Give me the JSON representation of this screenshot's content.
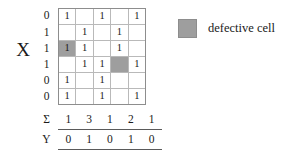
{
  "figure": {
    "axis_label_x": "X",
    "row_labels": [
      "0",
      "1",
      "1",
      "1",
      "0",
      "0"
    ],
    "grid": {
      "rows": 6,
      "cols": 5,
      "cells": [
        [
          "1",
          "",
          "1",
          "",
          "1"
        ],
        [
          "",
          "1",
          "",
          "1",
          ""
        ],
        [
          "1",
          "1",
          "",
          "1",
          ""
        ],
        [
          "",
          "1",
          "1",
          "",
          "1"
        ],
        [
          "1",
          "",
          "1",
          "",
          ""
        ],
        [
          "1",
          "",
          "1",
          "",
          "1"
        ]
      ],
      "defective": [
        [
          2,
          0
        ],
        [
          3,
          3
        ]
      ]
    },
    "summary": {
      "sigma_label": "Σ",
      "y_label": "Y",
      "sigma_values": [
        "1",
        "3",
        "1",
        "2",
        "1"
      ],
      "y_values": [
        "0",
        "1",
        "0",
        "1",
        "0"
      ]
    },
    "legend": {
      "swatch_name": "defective-cell-swatch",
      "label": "defective cell",
      "swatch_color": "#9e9e9e"
    },
    "colors": {
      "grid_outer_border": "#8d8d8d",
      "grid_inner_line": "#b9b9b9",
      "defective_fill": "#9e9e9e",
      "rule": "#5a5a5a",
      "text": "#1a1a1a",
      "background": "#ffffff"
    }
  }
}
